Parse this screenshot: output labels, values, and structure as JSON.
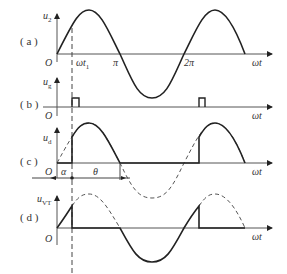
{
  "panels": {
    "a": {
      "tag": "( a )",
      "ylabel": "u",
      "ysub": "2",
      "ticks": [
        "O",
        "ωt",
        "π",
        "2π"
      ],
      "ticksub": "1",
      "xlabel": "ωt"
    },
    "b": {
      "tag": "( b )",
      "ylabel": "u",
      "ysub": "g",
      "origin": "O",
      "xlabel": "ωt"
    },
    "c": {
      "tag": "( c )",
      "ylabel": "u",
      "ysub": "d",
      "origin": "O",
      "alpha": "α",
      "theta": "θ",
      "xlabel": "ωt"
    },
    "d": {
      "tag": "( d )",
      "ylabel": "u",
      "ysub": "VT",
      "origin": "O",
      "xlabel": "ωt"
    }
  },
  "colors": {
    "stroke": "#222222",
    "dashed": "#555555",
    "text": "#333333"
  }
}
